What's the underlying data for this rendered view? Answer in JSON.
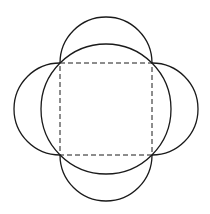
{
  "diagram": {
    "colors": {
      "background": "#ffffff",
      "stroke": "#1a1a1a"
    },
    "square": {
      "x": 60,
      "y": 63,
      "side": 92,
      "style": "dashed"
    },
    "circumcircle": {
      "cx": 106,
      "cy": 109,
      "r": 65
    },
    "semicircles": [
      {
        "side": "top",
        "cx": 106,
        "cy": 63,
        "r": 46
      },
      {
        "side": "right",
        "cx": 152,
        "cy": 109,
        "r": 46
      },
      {
        "side": "bottom",
        "cx": 106,
        "cy": 155,
        "r": 46
      },
      {
        "side": "left",
        "cx": 60,
        "cy": 109,
        "r": 46
      }
    ]
  }
}
